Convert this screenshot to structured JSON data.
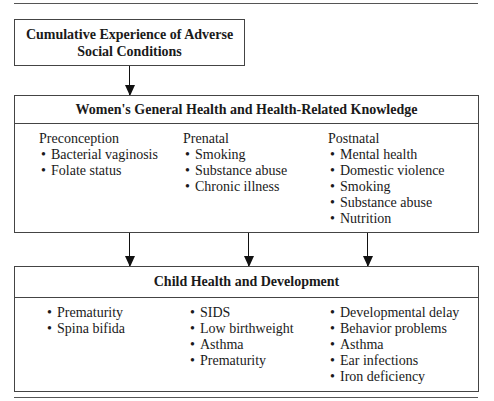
{
  "diagram": {
    "box1": {
      "title_line1": "Cumulative Experience of Adverse",
      "title_line2": "Social Conditions"
    },
    "box2": {
      "title": "Women's General Health and Health-Related Knowledge",
      "columns": [
        {
          "heading": "Preconception",
          "items": [
            "Bacterial vaginosis",
            "Folate status"
          ]
        },
        {
          "heading": "Prenatal",
          "items": [
            "Smoking",
            "Substance abuse",
            "Chronic illness"
          ]
        },
        {
          "heading": "Postnatal",
          "items": [
            "Mental health",
            "Domestic violence",
            "Smoking",
            "Substance abuse",
            "Nutrition"
          ]
        }
      ]
    },
    "box3": {
      "title": "Child Health and Development",
      "columns": [
        {
          "items": [
            "Prematurity",
            "Spina bifida"
          ]
        },
        {
          "items": [
            "SIDS",
            "Low birthweight",
            "Asthma",
            "Prematurity"
          ]
        },
        {
          "items": [
            "Developmental delay",
            "Behavior problems",
            "Asthma",
            "Ear infections",
            "Iron deficiency"
          ]
        }
      ]
    },
    "edges": [
      {
        "from": "box1",
        "to": "box2"
      },
      {
        "from": "box2.col0",
        "to": "box3"
      },
      {
        "from": "box2.col1",
        "to": "box3"
      },
      {
        "from": "box2.col2",
        "to": "box3"
      }
    ]
  }
}
